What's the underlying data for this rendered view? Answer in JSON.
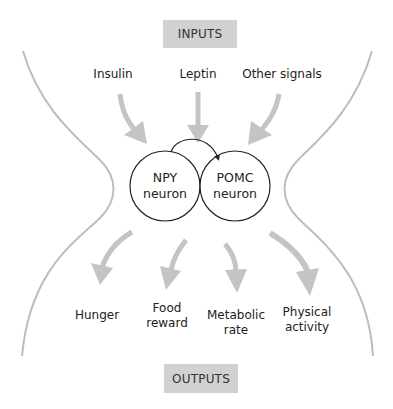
{
  "diagram": {
    "title_top": "INPUTS",
    "title_bottom": "OUTPUTS",
    "inputs": [
      {
        "label": "Insulin"
      },
      {
        "label": "Leptin"
      },
      {
        "label": "Other signals"
      }
    ],
    "nodes": [
      {
        "line1": "NPY",
        "line2": "neuron"
      },
      {
        "line1": "POMC",
        "line2": "neuron"
      }
    ],
    "outputs": [
      {
        "line1": "Hunger",
        "line2": ""
      },
      {
        "line1": "Food",
        "line2": "reward"
      },
      {
        "line1": "Metabolic",
        "line2": "rate"
      },
      {
        "line1": "Physical",
        "line2": "activity"
      }
    ],
    "colors": {
      "box_fill": "#d1d1d1",
      "arrow_gray": "#c4c4c4",
      "boundary_gray": "#bdbdbd",
      "node_stroke": "#222222"
    }
  }
}
